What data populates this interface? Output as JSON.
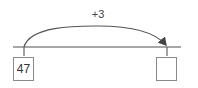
{
  "diagram": {
    "type": "number-line-jump",
    "jump_label": "+3",
    "start_value": "47",
    "end_value": "",
    "colors": {
      "line": "#8a8a8a",
      "arc": "#555555",
      "box_border": "#8a8a8a",
      "text": "#333333"
    }
  }
}
